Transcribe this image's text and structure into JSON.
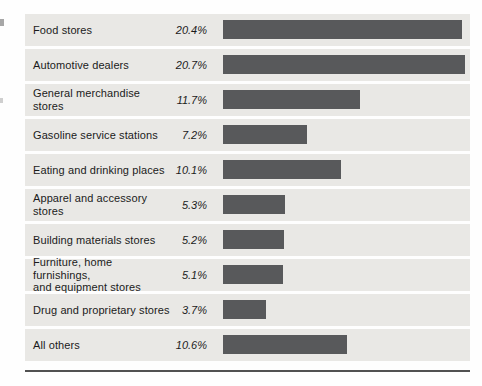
{
  "chart_data": {
    "type": "bar",
    "orientation": "horizontal",
    "title": "",
    "xlabel": "",
    "ylabel": "",
    "xlim": [
      0,
      21.1
    ],
    "grid": false,
    "legend": false,
    "categories": [
      "Food stores",
      "Automotive dealers",
      "General merchandise stores",
      "Gasoline service stations",
      "Eating and drinking places",
      "Apparel and accessory stores",
      "Building materials stores",
      "Furniture, home furnishings,\nand equipment stores",
      "Drug and proprietary stores",
      "All others"
    ],
    "values": [
      20.4,
      20.7,
      11.7,
      7.2,
      10.1,
      5.3,
      5.2,
      5.1,
      3.7,
      10.6
    ],
    "value_labels": [
      "20.4%",
      "20.7%",
      "11.7%",
      "7.2%",
      "10.1%",
      "5.3%",
      "5.2%",
      "5.1%",
      "3.7%",
      "10.6%"
    ]
  },
  "colors": {
    "bar": "#58595b",
    "row_background": "#e9e8e5",
    "rule": "#515151",
    "text": "#1b1b1b",
    "page_background": "#fefefe"
  }
}
